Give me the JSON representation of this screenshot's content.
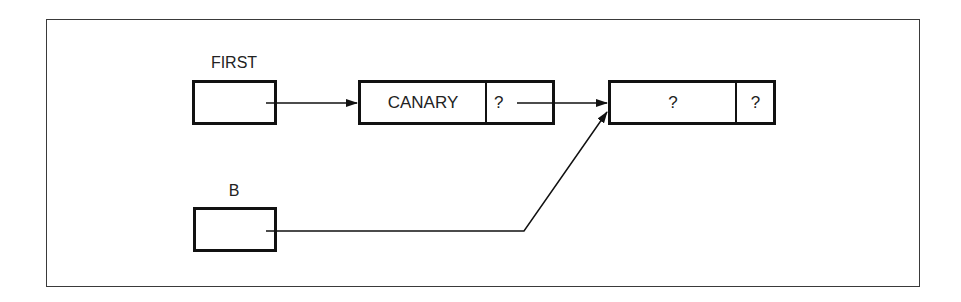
{
  "diagram": {
    "type": "linked-list-pointer-diagram",
    "variables": [
      {
        "id": "first",
        "label": "FIRST"
      },
      {
        "id": "b",
        "label": "B"
      }
    ],
    "nodes": [
      {
        "id": "node1",
        "data": "CANARY",
        "link": "?"
      },
      {
        "id": "node2",
        "data": "?",
        "link": "?"
      }
    ],
    "edges": [
      {
        "from": "first",
        "to": "node1"
      },
      {
        "from": "node1.link",
        "to": "node2"
      },
      {
        "from": "b",
        "to": "node2"
      }
    ]
  },
  "colors": {
    "line": "#111111",
    "frame": "#3a3a3a",
    "background": "#ffffff"
  }
}
